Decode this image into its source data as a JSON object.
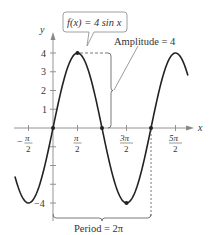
{
  "chart_data": {
    "type": "line",
    "title": "",
    "function_label": "f(x) = 4 sin x",
    "xlabel": "x",
    "ylabel": "y",
    "x_ticks": [
      "-π/2",
      "π/2",
      "3π/2",
      "5π/2"
    ],
    "x_tick_values": [
      -1.5708,
      1.5708,
      4.7124,
      7.854
    ],
    "y_ticks": [
      "-4",
      "1",
      "2",
      "3",
      "4"
    ],
    "y_tick_values": [
      -4,
      1,
      2,
      3,
      4
    ],
    "xlim": [
      -2.44,
      8.65
    ],
    "ylim": [
      -4.3,
      4.6
    ],
    "grid": false,
    "series": [
      {
        "name": "f(x) = 4 sin x",
        "x_range": [
          -2.44,
          8.65
        ],
        "amplitude": 4,
        "period": 6.2832,
        "key_points": [
          {
            "x": 0,
            "y": 0
          },
          {
            "x": 1.5708,
            "y": 4
          },
          {
            "x": 3.1416,
            "y": 0
          },
          {
            "x": 4.7124,
            "y": -4
          },
          {
            "x": 6.2832,
            "y": 0
          }
        ]
      }
    ],
    "annotations": [
      {
        "text": "Amplitude = 4",
        "target": "vertical distance from x-axis to max at x=π/2"
      },
      {
        "text": "Period = 2π",
        "target": "horizontal span from x=0 to x=2π"
      }
    ]
  },
  "labels": {
    "function_box": "f(x) = 4 sin x",
    "amplitude": "Amplitude = 4",
    "period": "Period = 2π",
    "x_axis": "x",
    "y_axis": "y",
    "xt": {
      "neg_half_pi_num": "π",
      "neg_sign": "−",
      "half_num": "π",
      "three_half_num": "3π",
      "five_half_num": "5π",
      "den": "2"
    },
    "yt": {
      "y4": "4",
      "y3": "3",
      "y2": "2",
      "y1": "1",
      "yneg4": "−4"
    }
  }
}
